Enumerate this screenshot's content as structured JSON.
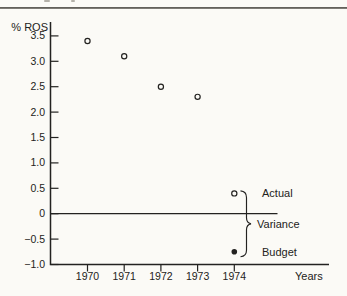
{
  "page": {
    "paper_color": "#fbfaf6",
    "ink_color": "#232220",
    "top_rule_color": "#56544f"
  },
  "chart_data": {
    "type": "scatter",
    "title": "",
    "ylabel": "% ROS",
    "xlabel": "Years",
    "categories": [
      "1970",
      "1971",
      "1972",
      "1973",
      "1974"
    ],
    "y_ticks": [
      {
        "label": "3.5",
        "value": 3.5
      },
      {
        "label": "3.0",
        "value": 3.0
      },
      {
        "label": "2.5",
        "value": 2.5
      },
      {
        "label": "2.0",
        "value": 2.0
      },
      {
        "label": "1.5",
        "value": 1.5
      },
      {
        "label": "1.0",
        "value": 1.0
      },
      {
        "label": "0.5",
        "value": 0.5
      },
      {
        "label": "0",
        "value": 0
      },
      {
        "label": "−0.5",
        "value": -0.5
      },
      {
        "label": "−1.0",
        "value": -1.0
      }
    ],
    "ylim": [
      -1.0,
      3.5
    ],
    "grid": false,
    "zero_line": true,
    "series": [
      {
        "name": "Actual",
        "marker": "open-circle",
        "x": [
          "1970",
          "1971",
          "1972",
          "1973",
          "1974"
        ],
        "values": [
          3.4,
          3.1,
          2.5,
          2.3,
          0.4
        ]
      },
      {
        "name": "Budget",
        "marker": "filled-circle",
        "x": [
          "1974"
        ],
        "values": [
          -0.75
        ]
      }
    ],
    "annotations": [
      {
        "label": "Actual",
        "type": "point-label",
        "target_value": 0.4
      },
      {
        "label": "Variance",
        "type": "brace",
        "from_value": 0.4,
        "to_value": -0.75
      },
      {
        "label": "Budget",
        "type": "point-label",
        "target_value": -0.75
      }
    ]
  }
}
